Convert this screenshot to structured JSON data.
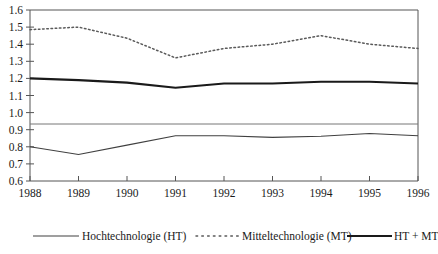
{
  "chart_data": {
    "type": "line",
    "title": "",
    "subtitle": "",
    "xlabel": "",
    "ylabel": "",
    "x": [
      1988,
      1989,
      1990,
      1991,
      1992,
      1993,
      1994,
      1995,
      1996
    ],
    "categories": [
      "1988",
      "1989",
      "1990",
      "1991",
      "1992",
      "1993",
      "1994",
      "1995",
      "1996"
    ],
    "xlim": [
      1988,
      1996
    ],
    "ylim": [
      0.6,
      1.6
    ],
    "yticks": [
      0.6,
      0.7,
      0.8,
      0.9,
      1.0,
      1.1,
      1.2,
      1.3,
      1.4,
      1.5,
      1.6
    ],
    "ytick_labels": [
      "0.6",
      "0.7",
      "0.8",
      "0.9",
      "1.0",
      "1.1",
      "1.2",
      "1.3",
      "1.4",
      "1.5",
      "1.6"
    ],
    "xticks": [
      1988,
      1989,
      1990,
      1991,
      1992,
      1993,
      1994,
      1995,
      1996
    ],
    "xtick_labels": [
      "1988",
      "1989",
      "1990",
      "1991",
      "1992",
      "1993",
      "1994",
      "1995",
      "1996"
    ],
    "grid": false,
    "reference_line": 1.0,
    "legend_position": "bottom",
    "series": [
      {
        "name": "Hochtechnologie (HT)",
        "style": "solid-thin",
        "color": "#404040",
        "values": [
          0.8,
          0.755,
          0.81,
          0.865,
          0.865,
          0.855,
          0.862,
          0.878,
          0.865
        ]
      },
      {
        "name": "Mitteltechnologie (MT)",
        "style": "dotted",
        "color": "#5a5a5a",
        "values": [
          1.485,
          1.5,
          1.435,
          1.32,
          1.375,
          1.4,
          1.45,
          1.4,
          1.375
        ]
      },
      {
        "name": "HT + MT",
        "style": "solid-thick",
        "color": "#1a1a1a",
        "values": [
          1.2,
          1.19,
          1.175,
          1.145,
          1.17,
          1.17,
          1.18,
          1.18,
          1.17
        ]
      }
    ]
  },
  "axes": {
    "y_labels": [
      "1.6",
      "1.5",
      "1.4",
      "1.3",
      "1.2",
      "1.1",
      "1.0",
      "0.9",
      "0.8",
      "0.7",
      "0.6"
    ],
    "x_labels": [
      "1988",
      "1989",
      "1990",
      "1991",
      "1992",
      "1993",
      "1994",
      "1995",
      "1996"
    ]
  },
  "legend": {
    "items": [
      {
        "label": "Hochtechnologie (HT)",
        "style": "solid-thin"
      },
      {
        "label": "Mitteltechnologie (MT)",
        "style": "dotted"
      },
      {
        "label": "HT + MT",
        "style": "solid-thick"
      }
    ]
  }
}
